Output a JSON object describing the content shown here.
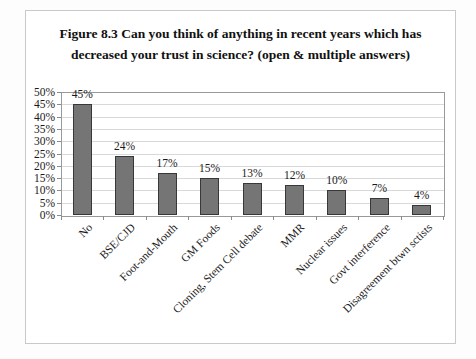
{
  "figure": {
    "title_line1": "Figure 8.3  Can you think of anything in recent years which has",
    "title_line2": "decreased your trust in science? (open & multiple answers)"
  },
  "chart_data": {
    "type": "bar",
    "title": "Figure 8.3 Can you think of anything in recent years which has decreased your trust in science? (open & multiple answers)",
    "categories": [
      "No",
      "BSE/CJD",
      "Foot-and-Mouth",
      "GM Foods",
      "Cloning, Stem Cell debate",
      "MMR",
      "Nuclear issues",
      "Govt interference",
      "Disagreement btwn sctists"
    ],
    "values": [
      45,
      24,
      17,
      15,
      13,
      12,
      10,
      7,
      4
    ],
    "data_labels": [
      "45%",
      "24%",
      "17%",
      "15%",
      "13%",
      "12%",
      "10%",
      "7%",
      "4%"
    ],
    "xlabel": "",
    "ylabel": "",
    "ylim": [
      0,
      50
    ],
    "ytick_step": 5,
    "ytick_labels": [
      "0%",
      "5%",
      "10%",
      "15%",
      "20%",
      "25%",
      "30%",
      "35%",
      "40%",
      "45%",
      "50%"
    ],
    "grid": true,
    "legend": "none",
    "bar_color": "#757575",
    "bar_border_color": "#383838",
    "gridline_color": "#d9d9d9",
    "plot_border_color": "#999999",
    "tick_color": "#8a8a8a"
  }
}
